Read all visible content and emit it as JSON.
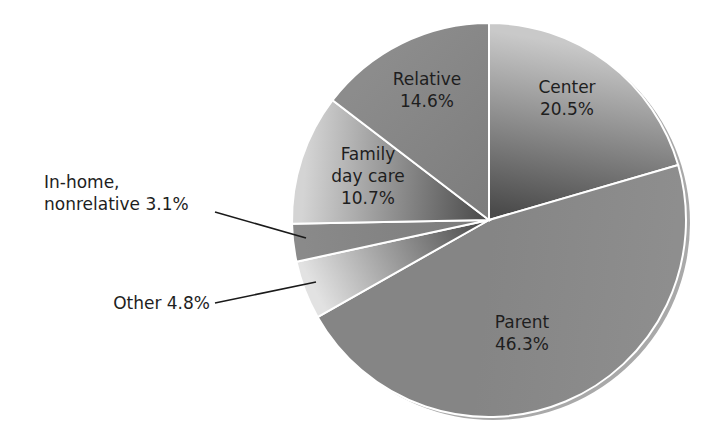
{
  "chart_data": {
    "type": "pie",
    "title": "",
    "start_angle_deg": 0,
    "direction": "clockwise",
    "slices": [
      {
        "label": "Center",
        "value": 20.5,
        "display": [
          "Center",
          "20.5%"
        ],
        "color_light": "#c9c9c9",
        "color_dark": "#4a4a4a",
        "label_pos": [
          567,
          93
        ],
        "callout": null
      },
      {
        "label": "Parent",
        "value": 46.3,
        "display": [
          "Parent",
          "46.3%"
        ],
        "color_light": "#8e8e8e",
        "color_dark": "#858585",
        "label_pos": [
          522,
          328
        ],
        "callout": null
      },
      {
        "label": "Other",
        "value": 4.8,
        "display": [
          "Other 4.8%"
        ],
        "color_light": "#e2e2e2",
        "color_dark": "#4e4e4e",
        "label_pos": null,
        "callout": {
          "text_x": 210,
          "text_y": 309,
          "anchor": "end",
          "line": [
            [
              215,
              303
            ],
            [
              316,
              282
            ]
          ]
        }
      },
      {
        "label": "In-home, nonrelative",
        "value": 3.1,
        "display": [
          "In-home,",
          "nonrelative 3.1%"
        ],
        "color_light": "#8a8a8a",
        "color_dark": "#7c7c7c",
        "label_pos": null,
        "callout": {
          "text_x": 44,
          "text_y": 188,
          "anchor": "start",
          "line": [
            [
              215,
              212
            ],
            [
              306,
              238
            ]
          ]
        }
      },
      {
        "label": "Family day care",
        "value": 10.7,
        "display": [
          "Family",
          "day care",
          "10.7%"
        ],
        "color_light": "#d4d4d4",
        "color_dark": "#4f4f4f",
        "label_pos": [
          368,
          160
        ],
        "callout": null
      },
      {
        "label": "Relative",
        "value": 14.6,
        "display": [
          "Relative",
          "14.6%"
        ],
        "color_light": "#8c8c8c",
        "color_dark": "#7d7d7d",
        "label_pos": [
          427,
          85
        ],
        "callout": null
      }
    ],
    "total": 100.0,
    "legend": "none (direct labels)"
  },
  "layout": {
    "cx": 489,
    "cy": 220,
    "r": 197,
    "rim_color": "#a9a9a9",
    "separator_color": "#ffffff"
  }
}
